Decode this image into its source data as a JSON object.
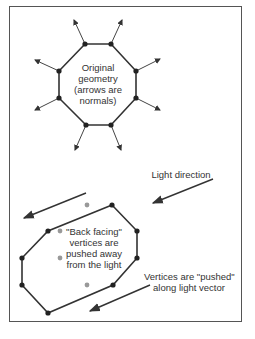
{
  "diagram": {
    "top": {
      "label_lines": [
        "Original",
        "geometry",
        "(arrows are",
        "normals)"
      ]
    },
    "bottom": {
      "light_direction_label": "Light direction",
      "back_facing_lines": [
        "\"Back facing\"",
        "vertices are",
        "pushed away",
        "from the light"
      ],
      "pushed_lines": [
        "Vertices are \"pushed\"",
        "along light vector"
      ]
    },
    "colors": {
      "line": "#333333",
      "vertex": "#222222",
      "ghost_vertex": "#999999",
      "border": "#555555"
    }
  }
}
